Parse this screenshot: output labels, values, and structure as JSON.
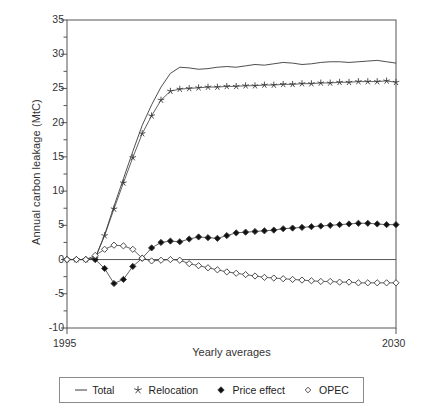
{
  "chart_data": {
    "type": "line",
    "title": "",
    "xlabel": "Yearly averages",
    "ylabel": "Annual carbon leakage (MtC)",
    "xlim": [
      1995,
      2030
    ],
    "ylim": [
      -10,
      35
    ],
    "ytick_labels": [
      "35",
      "30",
      "25",
      "20",
      "15",
      "10",
      "5",
      "0",
      "-5",
      "-10"
    ],
    "ytick_values": [
      35,
      30,
      25,
      20,
      15,
      10,
      5,
      0,
      -5,
      -10
    ],
    "yminor_values": [
      32.5,
      27.5,
      22.5,
      17.5,
      12.5,
      7.5,
      2.5,
      -2.5,
      -7.5
    ],
    "xtick_labels": [
      "1995",
      "2030"
    ],
    "xtick_values": [
      1995,
      2030
    ],
    "grid": false,
    "legend_position": "below-plot",
    "x": [
      1995,
      1996,
      1997,
      1998,
      1999,
      2000,
      2001,
      2002,
      2003,
      2004,
      2005,
      2006,
      2007,
      2008,
      2009,
      2010,
      2011,
      2012,
      2013,
      2014,
      2015,
      2016,
      2017,
      2018,
      2019,
      2020,
      2021,
      2022,
      2023,
      2024,
      2025,
      2026,
      2027,
      2028,
      2029,
      2030
    ],
    "series": [
      {
        "name": "Total",
        "marker": "none",
        "values": [
          0,
          0,
          0,
          0.2,
          3.6,
          7.8,
          11.8,
          15.8,
          19.6,
          22.6,
          25.2,
          27.2,
          28.1,
          28.0,
          27.8,
          27.9,
          28.1,
          28.2,
          28.1,
          28.3,
          28.5,
          28.4,
          28.6,
          28.8,
          28.7,
          28.5,
          28.6,
          28.8,
          28.9,
          28.9,
          28.8,
          28.9,
          29.0,
          29.1,
          28.9,
          28.7
        ]
      },
      {
        "name": "Relocation",
        "marker": "star",
        "values": [
          0,
          0,
          0,
          0.2,
          3.5,
          7.4,
          11.2,
          14.9,
          18.4,
          21.0,
          23.3,
          24.6,
          24.9,
          25.0,
          25.1,
          25.2,
          25.2,
          25.3,
          25.3,
          25.4,
          25.4,
          25.5,
          25.5,
          25.6,
          25.6,
          25.7,
          25.7,
          25.8,
          25.8,
          25.9,
          25.9,
          26.0,
          26.0,
          26.0,
          26.1,
          25.9
        ]
      },
      {
        "name": "Price effect",
        "marker": "filled-diamond",
        "values": [
          0,
          0,
          0,
          0,
          -1.3,
          -3.5,
          -2.9,
          -1.0,
          0.2,
          1.7,
          2.5,
          2.7,
          2.6,
          3.0,
          3.3,
          3.2,
          3.1,
          3.5,
          3.9,
          4.0,
          4.1,
          4.2,
          4.3,
          4.5,
          4.6,
          4.7,
          4.8,
          4.9,
          5.0,
          5.1,
          5.2,
          5.3,
          5.3,
          5.2,
          5.1,
          5.1
        ]
      },
      {
        "name": "OPEC",
        "marker": "open-diamond",
        "values": [
          0,
          0,
          0,
          0.6,
          1.5,
          2.1,
          2.0,
          1.5,
          0.2,
          -0.2,
          -0.1,
          0.0,
          -0.1,
          -0.6,
          -0.9,
          -1.2,
          -1.5,
          -1.8,
          -2.0,
          -2.2,
          -2.4,
          -2.6,
          -2.7,
          -2.8,
          -2.9,
          -3.0,
          -3.1,
          -3.2,
          -3.2,
          -3.3,
          -3.3,
          -3.4,
          -3.4,
          -3.4,
          -3.4,
          -3.4
        ]
      }
    ]
  },
  "legend": {
    "items": [
      {
        "label": "Total",
        "marker": "line"
      },
      {
        "label": "Relocation",
        "marker": "star"
      },
      {
        "label": "Price effect",
        "marker": "filled-diamond"
      },
      {
        "label": "OPEC",
        "marker": "open-diamond"
      }
    ]
  },
  "colors": {
    "axis": "#555555",
    "line": "#3a3a3a",
    "marker_fill": "#111111",
    "marker_open": "#ffffff",
    "background": "#ffffff"
  }
}
